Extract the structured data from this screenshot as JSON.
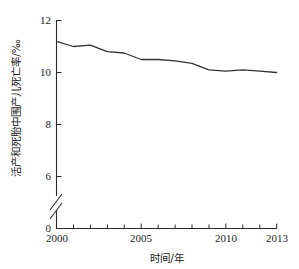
{
  "chart_data": {
    "type": "line",
    "title": "",
    "subtitle": "",
    "xlabel": "时间/年",
    "ylabel": "活产和死胎中围产儿死亡率/‰",
    "x": [
      2000,
      2001,
      2002,
      2003,
      2004,
      2005,
      2006,
      2007,
      2008,
      2009,
      2010,
      2011,
      2012,
      2013
    ],
    "series": [
      {
        "name": "围产儿死亡率",
        "values": [
          11.2,
          11.0,
          11.05,
          10.8,
          10.75,
          10.5,
          10.5,
          10.45,
          10.35,
          10.1,
          10.05,
          10.1,
          10.05,
          10.0
        ]
      }
    ],
    "xlim": [
      2000,
      2013
    ],
    "ylim": [
      0,
      12
    ],
    "xticks": [
      2000,
      2001,
      2002,
      2003,
      2004,
      2005,
      2006,
      2007,
      2008,
      2009,
      2010,
      2011,
      2012,
      2013
    ],
    "xticklabels_shown": [
      "2000",
      "2005",
      "2010",
      "2013"
    ],
    "yticks": [
      0,
      6,
      8,
      10,
      12
    ],
    "yticklabels": [
      "0",
      "6",
      "8",
      "10",
      "12"
    ],
    "grid": false,
    "legend": "none",
    "axis_break": true,
    "line_color": "#333333"
  },
  "axes": {
    "y_tick_labels": [
      {
        "value": "12"
      },
      {
        "value": "10"
      },
      {
        "value": "8"
      },
      {
        "value": "6"
      },
      {
        "value": "0"
      }
    ],
    "x_tick_labels": [
      {
        "value": "2000"
      },
      {
        "value": "2005"
      },
      {
        "value": "2010"
      },
      {
        "value": "2013"
      }
    ],
    "x_axis_title": "时间/年",
    "y_axis_title": "活产和死胎中围产儿死亡率/‰"
  }
}
